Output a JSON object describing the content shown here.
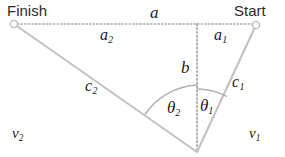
{
  "figure": {
    "width": 285,
    "height": 157,
    "background_color": "#ffffff",
    "line_color": "#b9b9b9",
    "dotted_color": "#a8a8a8",
    "arc_color": "#b0b0b0",
    "text_color": "#1b1b1b"
  },
  "endpoints": {
    "finish_label": "Finish",
    "start_label": "Start"
  },
  "segments": {
    "total_horizontal": "a",
    "right_horizontal": "a",
    "right_horizontal_sub": "1",
    "left_horizontal": "a",
    "left_horizontal_sub": "2",
    "vertical": "b",
    "left_ray": "c",
    "left_ray_sub": "2",
    "right_ray": "c",
    "right_ray_sub": "1"
  },
  "angles": {
    "theta_right": "θ",
    "theta_right_sub": "1",
    "theta_left": "θ",
    "theta_left_sub": "2"
  },
  "media": {
    "left_speed": "v",
    "left_speed_sub": "2",
    "right_speed": "v",
    "right_speed_sub": "1"
  },
  "geometry": {
    "finish_point": [
      14,
      24
    ],
    "start_point": [
      256,
      25
    ],
    "apex_point": [
      197,
      152
    ],
    "foot_point": [
      197,
      24
    ],
    "arc_radius_theta2": 67,
    "arc_radius_theta1": 63
  }
}
